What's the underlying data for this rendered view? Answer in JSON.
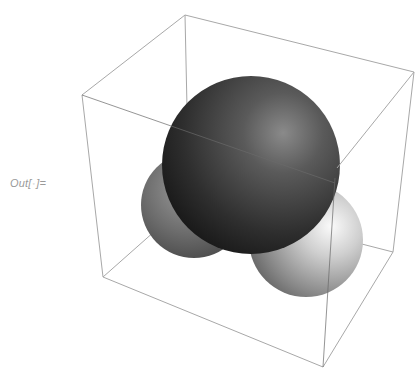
{
  "notebook": {
    "output_cell": {
      "label_prefix": "Out[",
      "label_marker": "◦",
      "label_suffix": "]="
    }
  },
  "graphics3d": {
    "box_color": "#a8a8a8",
    "spheres": [
      {
        "name": "left-sphere",
        "shade": "medium-gray",
        "highlight": "#9a9a9a",
        "base": "#6a6a6a",
        "edge": "#4a4a4a"
      },
      {
        "name": "right-sphere",
        "shade": "light-gray",
        "highlight": "#f4f4f4",
        "base": "#a9a9a9",
        "edge": "#6e6e6e"
      },
      {
        "name": "center-sphere",
        "shade": "dark-gray",
        "highlight": "#8e8e8e",
        "base": "#3a3a3a",
        "edge": "#1c1c1c"
      }
    ]
  }
}
